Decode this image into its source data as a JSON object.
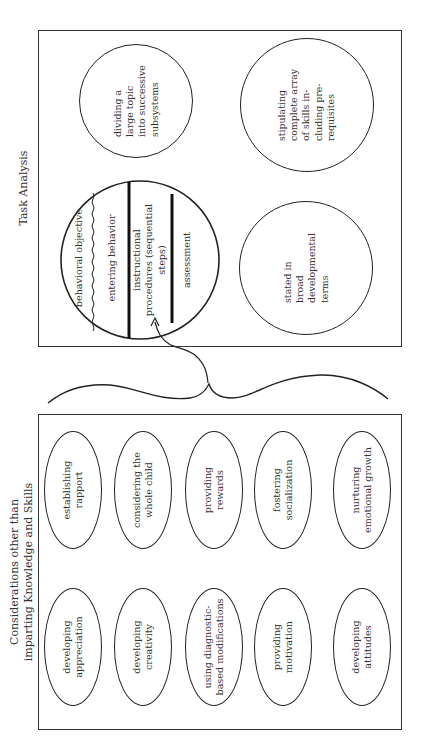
{
  "task_analysis": {
    "title": "Task Analysis",
    "lesson_plan_segments": [
      "behavioral objective",
      "entering behavior",
      "instructional procedures (sequential steps)",
      "assessment"
    ],
    "circles": [
      "dividing a large topic into successive subsystems",
      "stipulating complete array of skills including prerequisites",
      "stated in broad developmental terms"
    ],
    "circle_lines": [
      [
        "dividing a",
        "large topic",
        "into successive",
        "subsystems"
      ],
      [
        "stipulating",
        "complete array",
        "of skills in-",
        "cluding pre-",
        "requisites"
      ],
      [
        "stated in",
        "broad",
        "developmental",
        "terms"
      ]
    ],
    "segment_lines": [
      [
        "behavioral objective"
      ],
      [
        "entering behavior"
      ],
      [
        "instructional",
        "procedures (sequential",
        "steps)"
      ],
      [
        "assessment"
      ]
    ]
  },
  "considerations": {
    "title_line1": "Considerations other than",
    "title_line2": "imparting Knowledge and Skills",
    "ovals": [
      {
        "lines": [
          "establishing",
          "rapport"
        ]
      },
      {
        "lines": [
          "considering the",
          "whole child"
        ]
      },
      {
        "lines": [
          "providing",
          "rewards"
        ]
      },
      {
        "lines": [
          "fostering",
          "socialization"
        ]
      },
      {
        "lines": [
          "nurturing",
          "emotional growth"
        ]
      },
      {
        "lines": [
          "developing",
          "appreciation"
        ]
      },
      {
        "lines": [
          "developing",
          "creativity"
        ]
      },
      {
        "lines": [
          "using diagnostic-",
          "based modifications"
        ]
      },
      {
        "lines": [
          "providing",
          "motivation"
        ]
      },
      {
        "lines": [
          "developing",
          "attitudes"
        ]
      }
    ]
  },
  "connectors": {
    "brace": "curly-brace",
    "arrow": "curved-arrow-to-instructional-procedures"
  }
}
